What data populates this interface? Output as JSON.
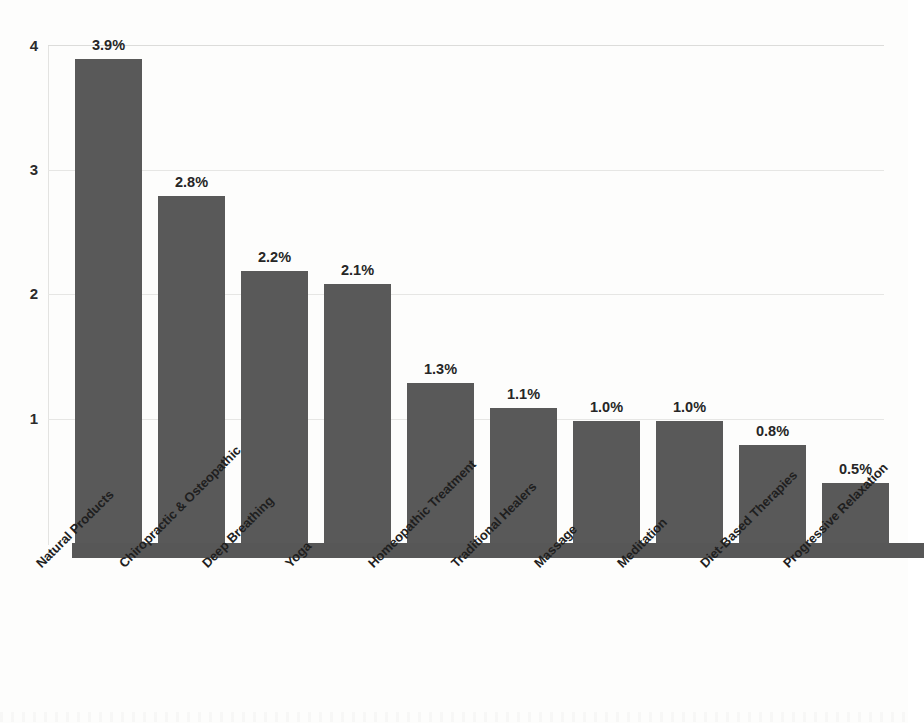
{
  "chart_data": {
    "type": "bar",
    "title": "",
    "subtitle": "",
    "xlabel": "",
    "ylabel": "",
    "ylim": [
      0,
      4.2
    ],
    "yticks": [
      "1",
      "2",
      "3",
      "4"
    ],
    "ytick_values": [
      1,
      2,
      3,
      4
    ],
    "grid": true,
    "legend": "none",
    "orientation": "vertical",
    "bar_color": "#595959",
    "label_color": "#262626",
    "gridline_color": "#e6e6e4",
    "baseline_color": "#575757",
    "background": "#fdfdfc",
    "categories": [
      "Natural Products",
      "Chiropractic & Osteopathic",
      "Deep Breathing",
      "Yoga",
      "Homeopathic Treatment",
      "Traditional Healers",
      "Massage",
      "Meditation",
      "Diet-Based Therapies",
      "Progressive Relaxation"
    ],
    "values": [
      3.9,
      2.8,
      2.2,
      2.1,
      1.3,
      1.1,
      1.0,
      1.0,
      0.8,
      0.5
    ],
    "data_labels": [
      "3.9%",
      "2.8%",
      "2.2%",
      "2.1%",
      "1.3%",
      "1.1%",
      "1.0%",
      "1.0%",
      "0.8%",
      "0.5%"
    ],
    "value_unit": "%"
  },
  "axis": {
    "y": {
      "tick_4": "4",
      "tick_3": "3",
      "tick_2": "2",
      "tick_1": "1"
    }
  },
  "bars": [
    {
      "label": "3.9%",
      "category": "Natural Products"
    },
    {
      "label": "2.8%",
      "category": "Chiropractic & Osteopathic"
    },
    {
      "label": "2.2%",
      "category": "Deep Breathing"
    },
    {
      "label": "2.1%",
      "category": "Yoga"
    },
    {
      "label": "1.3%",
      "category": "Homeopathic Treatment"
    },
    {
      "label": "1.1%",
      "category": "Traditional Healers"
    },
    {
      "label": "1.0%",
      "category": "Massage"
    },
    {
      "label": "1.0%",
      "category": "Meditation"
    },
    {
      "label": "0.8%",
      "category": "Diet-Based Therapies"
    },
    {
      "label": "0.5%",
      "category": "Progressive Relaxation"
    }
  ]
}
